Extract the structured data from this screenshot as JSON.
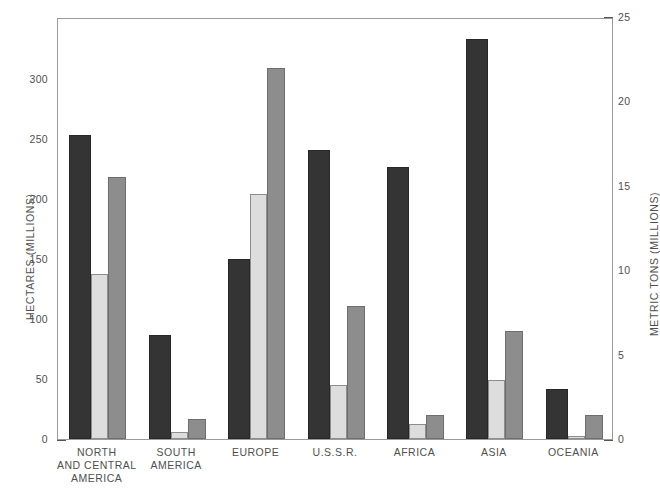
{
  "chart_data": {
    "type": "bar",
    "title": "",
    "categories": [
      "NORTH AND CENTRAL AMERICA",
      "SOUTH AMERICA",
      "EUROPE",
      "U.S.S.R.",
      "AFRICA",
      "ASIA",
      "OCEANIA"
    ],
    "category_lines": [
      [
        "NORTH",
        "AND CENTRAL",
        "AMERICA"
      ],
      [
        "SOUTH",
        "AMERICA"
      ],
      [
        "EUROPE"
      ],
      [
        "U.S.S.R."
      ],
      [
        "AFRICA"
      ],
      [
        "ASIA"
      ],
      [
        "OCEANIA"
      ]
    ],
    "series": [
      {
        "name": "HECTARES (MILLIONS)",
        "axis": "left",
        "color": "#343434",
        "values": [
          254,
          87,
          150,
          241,
          227,
          334,
          42
        ]
      },
      {
        "name": "FERTILIZER (METRIC TONS, MILLIONS)",
        "axis": "right",
        "color": "#dddddd",
        "values": [
          9.8,
          0.4,
          14.5,
          3.2,
          0.9,
          3.5,
          0.15
        ]
      },
      {
        "name": "PRODUCTION (METRIC TONS, MILLIONS)",
        "axis": "right",
        "color": "#8d8d8d",
        "values": [
          15.5,
          1.2,
          22.0,
          7.9,
          1.4,
          6.4,
          1.4
        ]
      }
    ],
    "left_axis": {
      "label": "HECTARES (MILLIONS)",
      "ticks": [
        0,
        50,
        100,
        150,
        200,
        250,
        300
      ],
      "tick_labels": [
        "0",
        "50",
        "100",
        "150",
        "200",
        "250",
        "300"
      ],
      "ylim": [
        0,
        352
      ]
    },
    "right_axis": {
      "label": "METRIC TONS (MILLIONS)",
      "ticks": [
        0,
        5,
        10,
        15,
        20,
        25
      ],
      "tick_labels": [
        "0",
        "5",
        "10",
        "15",
        "20",
        "25"
      ],
      "ylim": [
        0,
        25
      ]
    },
    "left_values_in_hectares": {
      "NORTH AND CENTRAL AMERICA": 254,
      "SOUTH AMERICA": 87,
      "EUROPE": 150,
      "U.S.S.R.": 241,
      "AFRICA": 227,
      "ASIA": 334,
      "OCEANIA": 42
    },
    "right_values_light_bar": {
      "NORTH AND CENTRAL AMERICA": 9.8,
      "SOUTH AMERICA": 0.4,
      "EUROPE": 14.5,
      "U.S.S.R.": 3.2,
      "AFRICA": 0.9,
      "ASIA": 3.5,
      "OCEANIA": 0.15
    },
    "right_values_gray_bar": {
      "NORTH AND CENTRAL AMERICA": 15.5,
      "SOUTH AMERICA": 1.2,
      "EUROPE": 22.0,
      "U.S.S.R.": 7.9,
      "AFRICA": 1.4,
      "ASIA": 6.4,
      "OCEANIA": 1.4
    },
    "grid": false,
    "legend": "none",
    "xlabel": "",
    "ylabel": "HECTARES (MILLIONS)"
  },
  "colors": {
    "dark_bar": "#343434",
    "light_bar": "#dddddd",
    "gray_bar": "#8d8d8d",
    "frame": "#9a9a9a",
    "text": "#4f4f4f",
    "background": "#ffffff"
  }
}
